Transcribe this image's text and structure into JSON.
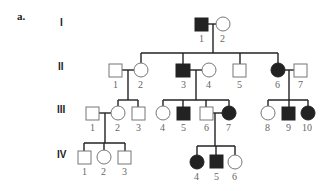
{
  "panel_label": "a.",
  "generations": [
    "I",
    "II",
    "III",
    "IV"
  ],
  "individuals": {
    "I": [
      {
        "id": "1",
        "sex": "male",
        "affected": true
      },
      {
        "id": "2",
        "sex": "female",
        "affected": false
      }
    ],
    "II": [
      {
        "id": "1",
        "sex": "male",
        "affected": false
      },
      {
        "id": "2",
        "sex": "female",
        "affected": false
      },
      {
        "id": "3",
        "sex": "male",
        "affected": true
      },
      {
        "id": "4",
        "sex": "female",
        "affected": false
      },
      {
        "id": "5",
        "sex": "male",
        "affected": false
      },
      {
        "id": "6",
        "sex": "female",
        "affected": true
      },
      {
        "id": "7",
        "sex": "male",
        "affected": false
      }
    ],
    "III": [
      {
        "id": "1",
        "sex": "male",
        "affected": false
      },
      {
        "id": "2",
        "sex": "female",
        "affected": false
      },
      {
        "id": "3",
        "sex": "male",
        "affected": false
      },
      {
        "id": "4",
        "sex": "female",
        "affected": false
      },
      {
        "id": "5",
        "sex": "male",
        "affected": true
      },
      {
        "id": "6",
        "sex": "male",
        "affected": false
      },
      {
        "id": "7",
        "sex": "female",
        "affected": true
      },
      {
        "id": "8",
        "sex": "female",
        "affected": false
      },
      {
        "id": "9",
        "sex": "male",
        "affected": true
      },
      {
        "id": "10",
        "sex": "female",
        "affected": true
      }
    ],
    "IV": [
      {
        "id": "1",
        "sex": "male",
        "affected": false
      },
      {
        "id": "2",
        "sex": "female",
        "affected": false
      },
      {
        "id": "3",
        "sex": "male",
        "affected": false
      },
      {
        "id": "4",
        "sex": "female",
        "affected": true
      },
      {
        "id": "5",
        "sex": "male",
        "affected": true
      },
      {
        "id": "6",
        "sex": "female",
        "affected": false
      }
    ]
  },
  "colors": {
    "affected": "#222222",
    "unaffected_stroke": "#777777",
    "line": "#222222"
  }
}
